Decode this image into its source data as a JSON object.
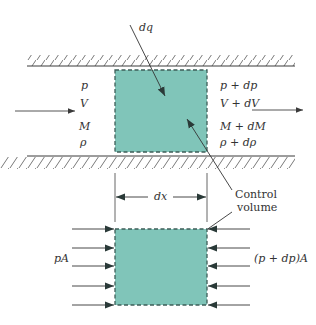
{
  "diagram": {
    "colors": {
      "fill": "#80c5b9",
      "border": "#3d5e58",
      "line": "#3a3a3a",
      "text": "#333333"
    },
    "top": {
      "heat_label": "dq",
      "inlet_labels": [
        "p",
        "V",
        "M",
        "ρ"
      ],
      "outlet_labels": [
        "p + dp",
        "V + dV",
        "M + dM",
        "ρ + dρ"
      ],
      "callout": {
        "line1": "Control",
        "line2": "volume"
      }
    },
    "bottom": {
      "width_label": "dx",
      "left_force_label": "pA",
      "right_force_label": "(p + dp)A",
      "force_arrow_count": 5
    }
  }
}
